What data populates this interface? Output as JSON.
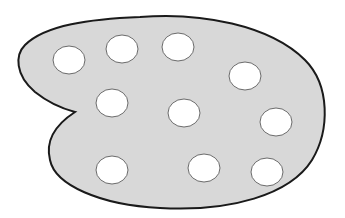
{
  "diagram": {
    "colors": {
      "background": "#ffffff",
      "palette_fill": "#d8d8d8",
      "palette_stroke": "#1a1a1a",
      "well_fill": "#ffffff",
      "well_stroke": "#6a6a6a"
    },
    "wells": [
      {
        "cx": 69,
        "cy": 60,
        "rx": 16,
        "ry": 14
      },
      {
        "cx": 122,
        "cy": 49,
        "rx": 16,
        "ry": 14
      },
      {
        "cx": 178,
        "cy": 47,
        "rx": 16,
        "ry": 14
      },
      {
        "cx": 245,
        "cy": 76,
        "rx": 16,
        "ry": 14
      },
      {
        "cx": 112,
        "cy": 103,
        "rx": 16,
        "ry": 14
      },
      {
        "cx": 184,
        "cy": 113,
        "rx": 16,
        "ry": 14
      },
      {
        "cx": 276,
        "cy": 122,
        "rx": 16,
        "ry": 14
      },
      {
        "cx": 112,
        "cy": 170,
        "rx": 16,
        "ry": 14
      },
      {
        "cx": 204,
        "cy": 168,
        "rx": 16,
        "ry": 14
      },
      {
        "cx": 267,
        "cy": 172,
        "rx": 16,
        "ry": 14
      }
    ]
  }
}
